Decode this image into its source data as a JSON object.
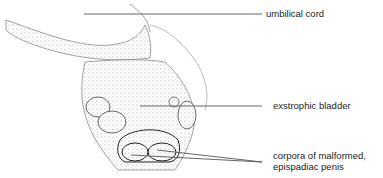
{
  "figure": {
    "labels": [
      {
        "id": "umbilical-cord",
        "text": "umbilical cord"
      },
      {
        "id": "exstrophic-bladder",
        "text": "exstrophic bladder"
      },
      {
        "id": "corpora",
        "line1": "corpora of malformed,",
        "line2": "epispadiac penis"
      }
    ],
    "colors": {
      "line": "#555555",
      "stipple": "#c9c9c9",
      "text": "#222222"
    }
  }
}
